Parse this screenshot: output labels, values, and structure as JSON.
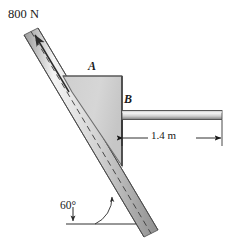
{
  "figure": {
    "kind": "statics-free-body-diagram"
  },
  "labels": {
    "force": "800 N",
    "point_a": "A",
    "point_b": "B",
    "dimension": "1.4 m",
    "angle": "60°"
  },
  "colors": {
    "line": "#1a1a1a",
    "block_fill": "#d2d2d2",
    "block_edge": "#6e6e6e",
    "rod_fill": "#c9c9c9",
    "rod_highlight": "#f2f2f2",
    "background": "#ffffff"
  },
  "geometry": {
    "incline_angle_deg": 60,
    "force_magnitude_n": 800,
    "bar_length_m": 1.4
  }
}
